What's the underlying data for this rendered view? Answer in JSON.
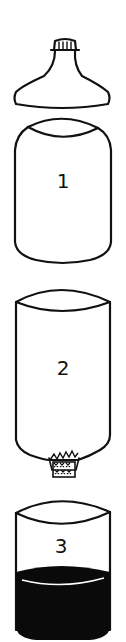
{
  "diagram": {
    "parts": [
      {
        "id": "top",
        "label": "",
        "name": "bottle top with cap"
      },
      {
        "id": "part1",
        "label": "1",
        "name": "upper cylinder section"
      },
      {
        "id": "part2",
        "label": "2",
        "name": "inverted funnel section with filter at neck"
      },
      {
        "id": "part3",
        "label": "3",
        "name": "bottom container with dark liquid"
      }
    ],
    "colors": {
      "line": "#111111",
      "background": "#ffffff",
      "liquid": "#0a0a0a"
    }
  }
}
